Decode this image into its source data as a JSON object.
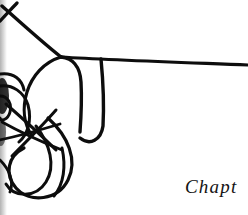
{
  "page": {
    "width": 248,
    "height": 215,
    "background_color": "#ffffff",
    "ink_color": "#0d0d0d",
    "kind": "scanned-book-page-fragment"
  },
  "caption": {
    "text": "Chapt",
    "full_word_implied": "Chapter",
    "clipped_at_right_edge": true,
    "style": "italic-serif",
    "color": "#141414",
    "x": 185,
    "y": 175
  },
  "artwork": {
    "title": "continuous-line tangled scribble drawing",
    "description": "A single looping pen line forming knots and teardrop loops at the left and lower-left, with one long nearly-horizontal stroke sweeping to the right edge.",
    "stroke_color": "#0d0d0d",
    "strokes": [
      {
        "name": "long-horizontal-sweep",
        "width": 3.2,
        "d": "M 61 57 C 110 60, 170 62, 248 65"
      },
      {
        "name": "upper-left-diagonal",
        "width": 3.4,
        "d": "M 2 6 C 20 22, 42 42, 61 57"
      },
      {
        "name": "upper-left-cross-stroke",
        "width": 3.2,
        "d": "M 17 3 C 12 8, 6 15, 0 21"
      },
      {
        "name": "big-rounded-panel",
        "width": 3.4,
        "d": "M 61 57 C 72 58, 80 66, 81 82 C 82 100, 81 118, 80 132"
      },
      {
        "name": "panel-right-shoulder",
        "width": 3.4,
        "d": "M 101 59 C 103 80, 104 108, 103 126 C 101 140, 90 146, 80 138"
      },
      {
        "name": "panel-left-arc",
        "width": 3.2,
        "d": "M 61 57 C 44 62, 32 76, 27 92 C 22 108, 24 124, 32 136"
      },
      {
        "name": "inner-arc-a",
        "width": 3.0,
        "d": "M 0 86 C 12 84, 24 92, 28 105 C 32 120, 28 134, 19 142"
      },
      {
        "name": "inner-arc-b",
        "width": 3.0,
        "d": "M 0 74 C 14 72, 22 80, 24 90"
      },
      {
        "name": "knot-cross-1",
        "width": 3.0,
        "d": "M 6 104 C 22 118, 40 134, 56 150"
      },
      {
        "name": "knot-cross-2",
        "width": 3.0,
        "d": "M 56 110 C 42 126, 26 142, 12 156"
      },
      {
        "name": "knot-cross-3",
        "width": 2.8,
        "d": "M 2 122 C 20 132, 42 142, 62 150"
      },
      {
        "name": "knot-cross-4",
        "width": 2.8,
        "d": "M 0 140 C 18 136, 40 130, 60 124"
      },
      {
        "name": "teardrop-loop-large",
        "width": 3.2,
        "d": "M 48 118 C 68 136, 78 160, 68 180 C 58 200, 30 204, 16 188 C 4 174, 8 156, 24 148"
      },
      {
        "name": "teardrop-loop-inner",
        "width": 3.0,
        "d": "M 36 126 C 50 144, 56 166, 46 182 C 36 198, 14 198, 6 184"
      },
      {
        "name": "lower-left-hook",
        "width": 2.8,
        "d": "M 0 160 C 10 170, 14 182, 10 192"
      },
      {
        "name": "descending-tail",
        "width": 3.0,
        "d": "M 62 148 C 66 166, 64 184, 54 196"
      },
      {
        "name": "small-loop-left-edge",
        "width": 3.0,
        "d": "M 0 96 C 8 96, 12 104, 10 112 C 8 120, 0 122, 0 118"
      }
    ],
    "ink_blobs": [
      {
        "name": "left-edge-dark-blot",
        "cx": 2,
        "cy": 96,
        "rx": 7,
        "ry": 18,
        "opacity": 0.85
      },
      {
        "name": "left-edge-dark-blot-lower",
        "cx": 1,
        "cy": 132,
        "rx": 5,
        "ry": 14,
        "opacity": 0.55
      }
    ]
  }
}
